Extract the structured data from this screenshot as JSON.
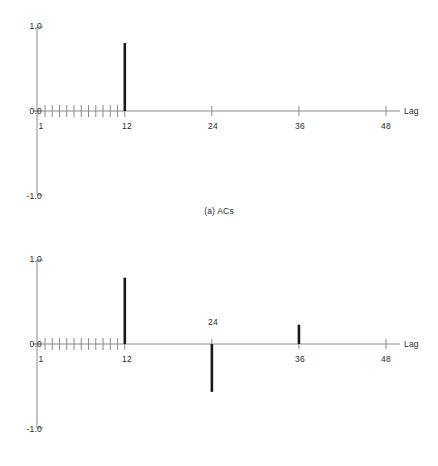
{
  "figure": {
    "width": 438,
    "height": 466,
    "background": "#ffffff",
    "line_color": "#8a8a8a",
    "spike_color": "#1a1a1a",
    "text_color": "#2b2b2b"
  },
  "chart_data": [
    {
      "type": "bar",
      "id": "acs",
      "title": "(a) ACs",
      "xlabel": "Lag",
      "ylabel": "",
      "xlim": [
        0,
        49
      ],
      "ylim": [
        -1.0,
        1.0
      ],
      "ytick_labels": [
        "1.0",
        "0.0",
        "-1.0"
      ],
      "ytick_values": [
        1.0,
        0.0,
        -1.0
      ],
      "xtick_labels": [
        "1",
        "12",
        "24",
        "36",
        "48"
      ],
      "xtick_values": [
        1,
        12,
        24,
        36,
        48
      ],
      "minor_xticks": [
        1,
        2,
        3,
        4,
        5,
        6,
        7,
        8,
        9,
        10,
        11,
        12
      ],
      "grid": false,
      "legend": "none",
      "categories": [
        1,
        2,
        3,
        4,
        5,
        6,
        7,
        8,
        9,
        10,
        11,
        12,
        24,
        36,
        48
      ],
      "values": [
        0,
        0,
        0,
        0,
        0,
        0,
        0,
        0,
        0,
        0,
        0,
        0.81,
        0,
        0,
        0
      ],
      "point_labels": []
    },
    {
      "type": "bar",
      "id": "pacs",
      "title": "(b) PACs",
      "xlabel": "Lag",
      "ylabel": "",
      "xlim": [
        0,
        49
      ],
      "ylim": [
        -1.0,
        1.0
      ],
      "ytick_labels": [
        "1.0",
        "0.0",
        "-1.0"
      ],
      "ytick_values": [
        1.0,
        0.0,
        -1.0
      ],
      "xtick_labels": [
        "1",
        "12",
        "24",
        "36",
        "48"
      ],
      "xtick_values": [
        1,
        12,
        24,
        36,
        48
      ],
      "minor_xticks": [
        1,
        2,
        3,
        4,
        5,
        6,
        7,
        8,
        9,
        10,
        11,
        12
      ],
      "grid": false,
      "legend": "none",
      "categories": [
        1,
        2,
        3,
        4,
        5,
        6,
        7,
        8,
        9,
        10,
        11,
        12,
        24,
        36,
        48
      ],
      "values": [
        0,
        0,
        0,
        0,
        0,
        0,
        0,
        0,
        0,
        0,
        0,
        0.79,
        -0.57,
        0.23,
        0
      ],
      "point_labels": [
        {
          "lag": 24,
          "text": "24",
          "position": "above-axis"
        }
      ]
    }
  ],
  "panel_a": {
    "caption": "(a) ACs",
    "axis_label": "Lag",
    "y_top": "1.0",
    "y_mid": "0.0",
    "y_bottom": "-1.0",
    "x1": "1",
    "x12": "12",
    "x24": "24",
    "x36": "36",
    "x48": "48"
  },
  "panel_b": {
    "caption": "(b) PACs",
    "axis_label": "Lag",
    "y_top": "1.0",
    "y_mid": "0.0",
    "y_bottom": "-1.0",
    "x1": "1",
    "x12": "12",
    "x24": "24",
    "x36": "36",
    "x48": "48",
    "inner_label_24": "24"
  }
}
